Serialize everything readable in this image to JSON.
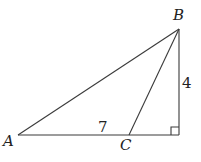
{
  "diagram": {
    "points": {
      "A": {
        "label": "A",
        "x": 18,
        "y": 135
      },
      "B": {
        "label": "B",
        "x": 179,
        "y": 29
      },
      "C": {
        "label": "C",
        "x": 129,
        "y": 135
      },
      "D": {
        "label": "",
        "x": 179,
        "y": 135
      }
    },
    "segments": [
      {
        "from": "A",
        "to": "B"
      },
      {
        "from": "B",
        "to": "C"
      },
      {
        "from": "B",
        "to": "D"
      },
      {
        "from": "A",
        "to": "D"
      }
    ],
    "lengths": {
      "AC": "7",
      "BD": "4"
    },
    "right_angle_at": "D",
    "colors": {
      "stroke": "#3a3a3a",
      "text": "#222222",
      "background": "#ffffff"
    }
  }
}
